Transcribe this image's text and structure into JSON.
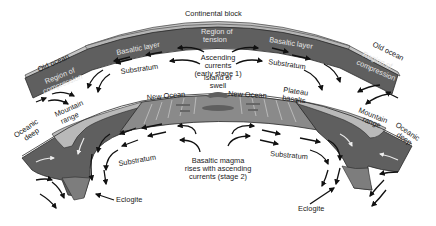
{
  "figure": {
    "colors": {
      "basaltic_layer": "#5f5f5f",
      "continental_light": "#b9b9b9",
      "new_ocean_floor": "#8a8a8a",
      "eclogite": "#7d7d7d",
      "outline": "#2a2a2a",
      "background": "#ffffff",
      "arrow": "#111111"
    }
  },
  "stage1": {
    "continental_block": "Continental block",
    "old_ocean_left": "Old ocean",
    "old_ocean_right": "Old ocean",
    "region_compression_left": [
      "Region of",
      "compression"
    ],
    "region_compression_right": [
      "Region of",
      "compression"
    ],
    "region_tension": [
      "Region of",
      "tension"
    ],
    "basaltic_layer_left": "Basaltic layer",
    "basaltic_layer_right": "Basaltic layer",
    "substratum_left": "Substratum",
    "substratum_right": "Substratum",
    "ascending_currents": [
      "Ascending",
      "currents",
      "(early stage 1)"
    ]
  },
  "stage2": {
    "island_or_swell": [
      "Island or",
      "swell"
    ],
    "new_ocean_left": "New Ocean",
    "new_ocean_right": "New Ocean",
    "plateau_basalts": [
      "Plateau",
      "basalts"
    ],
    "mountain_range_left": [
      "Mountain",
      "range"
    ],
    "mountain_range_right": [
      "Mountain",
      "range"
    ],
    "oceanic_deep_left": [
      "Oceanic",
      "deep"
    ],
    "oceanic_deep_right": [
      "Oceanic",
      "deep"
    ],
    "substratum_left": "Substratum",
    "substratum_right": "Substratum",
    "basaltic_magma": [
      "Basaltic magma",
      "rises with ascending",
      "currents (stage 2)"
    ],
    "eclogite_left": "Eclogite",
    "eclogite_right": "Eclogite"
  }
}
